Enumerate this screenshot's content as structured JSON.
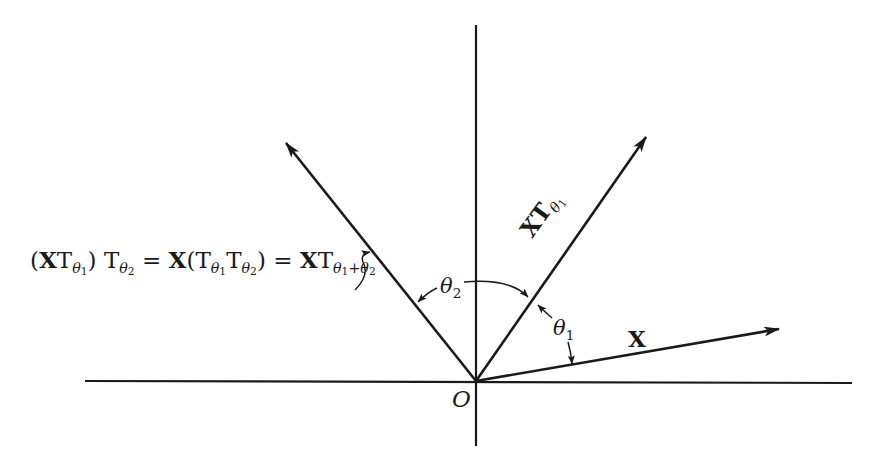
{
  "figure": {
    "origin_label": "O",
    "vectors": [
      {
        "id": "X",
        "label": "X",
        "angle_from_horizontal_deg": 10
      },
      {
        "id": "XT_theta1",
        "label_main": "XT",
        "label_sub": "θ",
        "label_subsub": "1",
        "angle_from_horizontal_deg": 57
      },
      {
        "id": "XT_theta1_plus_theta2",
        "label": "(XTθ₁)Tθ₂ = X(Tθ₁Tθ₂) = XTθ₁+θ₂",
        "angle_from_horizontal_deg": 131
      }
    ],
    "angles": [
      {
        "label": "θ",
        "sub": "1",
        "between": [
          "X",
          "XT_theta1"
        ]
      },
      {
        "label": "θ",
        "sub": "2",
        "between": [
          "XT_theta1",
          "XT_theta1_plus_theta2"
        ]
      }
    ],
    "equation": {
      "part1_open": "(",
      "part1_X": "X",
      "part1_T": "T",
      "part1_sub": "θ",
      "part1_subsub": "1",
      "part1_close": ")",
      "part2_T": "T",
      "part2_sub": "θ",
      "part2_subsub": "2",
      "eq1": " = ",
      "part3_X": "X",
      "part3_open": "(",
      "part3_T1": "T",
      "part3_sub1": "θ",
      "part3_subsub1": "1",
      "part3_T2": "T",
      "part3_sub2": "θ",
      "part3_subsub2": "2",
      "part3_close": ")",
      "eq2": " = ",
      "part4_X": "X",
      "part4_T": "T",
      "part4_sub_a": "θ",
      "part4_subsub_a": "1",
      "part4_plus": "+",
      "part4_sub_b": "θ",
      "part4_subsub_b": "2"
    },
    "labels": {
      "x_vector": "X",
      "xt_main": "XT",
      "xt_sub": "θ",
      "xt_subsub": "1",
      "theta1": "θ",
      "theta1_sub": "1",
      "theta2": "θ",
      "theta2_sub": "2",
      "origin": "O"
    },
    "colors": {
      "ink": "#1a1a1a",
      "background": "#ffffff"
    }
  }
}
